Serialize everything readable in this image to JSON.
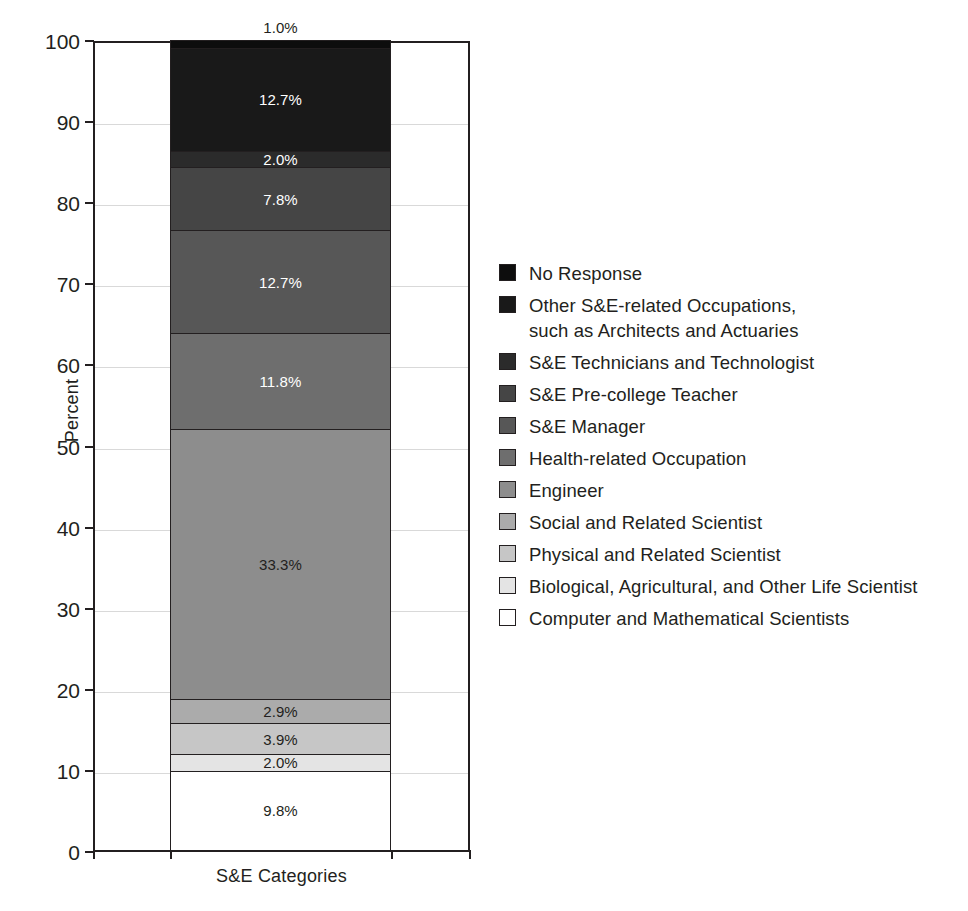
{
  "chart_data": {
    "type": "bar",
    "subtype": "stacked-bar-100",
    "title": "",
    "xlabel": "S&E Categories",
    "ylabel": "Percent",
    "ylim": [
      0,
      100
    ],
    "yticks": [
      0,
      10,
      20,
      30,
      40,
      50,
      60,
      70,
      80,
      90,
      100
    ],
    "ytick_labels": [
      "0",
      "10",
      "20",
      "30",
      "40",
      "50",
      "60",
      "70",
      "80",
      "90",
      "100"
    ],
    "categories": [
      "S&E Categories"
    ],
    "grid": true,
    "grid_axis": "y",
    "legend_position": "right",
    "value_unit": "%",
    "series": [
      {
        "name": "Computer and Mathematical Scientists",
        "values": [
          9.8
        ],
        "label": "9.8%",
        "color": "#ffffff",
        "label_color": "#231f20",
        "order_from_bottom": 1
      },
      {
        "name": "Biological, Agricultural, and Other Life Scientist",
        "values": [
          2.0
        ],
        "label": "2.0%",
        "color": "#e4e4e4",
        "label_color": "#231f20",
        "order_from_bottom": 2
      },
      {
        "name": "Physical and Related Scientist",
        "values": [
          3.9
        ],
        "label": "3.9%",
        "color": "#c6c6c6",
        "label_color": "#231f20",
        "order_from_bottom": 3
      },
      {
        "name": "Social and Related Scientist",
        "values": [
          2.9
        ],
        "label": "2.9%",
        "color": "#ababab",
        "label_color": "#231f20",
        "order_from_bottom": 4
      },
      {
        "name": "Engineer",
        "values": [
          33.3
        ],
        "label": "33.3%",
        "color": "#8d8d8d",
        "label_color": "#231f20",
        "order_from_bottom": 5
      },
      {
        "name": "Health-related Occupation",
        "values": [
          11.8
        ],
        "label": "11.8%",
        "color": "#6e6e6e",
        "label_color": "#ffffff",
        "order_from_bottom": 6
      },
      {
        "name": "S&E Manager",
        "values": [
          12.7
        ],
        "label": "12.7%",
        "color": "#575757",
        "label_color": "#ffffff",
        "order_from_bottom": 7
      },
      {
        "name": "S&E Pre-college Teacher",
        "values": [
          7.8
        ],
        "label": "7.8%",
        "color": "#454545",
        "label_color": "#ffffff",
        "order_from_bottom": 8
      },
      {
        "name": "S&E Technicians and Technologist",
        "values": [
          2.0
        ],
        "label": "2.0%",
        "color": "#2b2b2b",
        "label_color": "#ffffff",
        "order_from_bottom": 9
      },
      {
        "name": "Other S&E-related Occupations, such as Architects and Actuaries",
        "values": [
          12.7
        ],
        "label": "12.7%",
        "color": "#191919",
        "label_color": "#ffffff",
        "order_from_bottom": 10
      },
      {
        "name": "No Response",
        "values": [
          1.0
        ],
        "label": "1.0%",
        "color": "#0d0d0d",
        "label_color": "#231f20",
        "label_placement": "outside-top",
        "order_from_bottom": 11
      }
    ]
  },
  "axes": {
    "y_label": "Percent",
    "x_label": "S&E Categories",
    "y_ticks": [
      "100",
      "90",
      "80",
      "70",
      "60",
      "50",
      "40",
      "30",
      "20",
      "10",
      "0"
    ]
  },
  "legend": {
    "items": [
      {
        "label": "No Response",
        "color": "#0d0d0d"
      },
      {
        "label": "Other S&E-related Occupations,\nsuch as Architects and Actuaries",
        "color": "#191919"
      },
      {
        "label": "S&E Technicians and Technologist",
        "color": "#2b2b2b"
      },
      {
        "label": "S&E Pre-college Teacher",
        "color": "#454545"
      },
      {
        "label": "S&E Manager",
        "color": "#575757"
      },
      {
        "label": "Health-related Occupation",
        "color": "#6e6e6e"
      },
      {
        "label": "Engineer",
        "color": "#8d8d8d"
      },
      {
        "label": "Social and Related Scientist",
        "color": "#ababab"
      },
      {
        "label": "Physical and Related Scientist",
        "color": "#c6c6c6"
      },
      {
        "label": "Biological, Agricultural, and Other Life Scientist",
        "color": "#e4e4e4"
      },
      {
        "label": "Computer and Mathematical Scientists",
        "color": "#ffffff"
      }
    ]
  }
}
